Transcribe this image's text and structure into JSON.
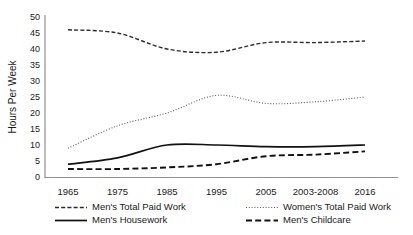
{
  "chart_data": {
    "type": "line",
    "title": "",
    "xlabel": "",
    "ylabel": "Hours Per Week",
    "ylim": [
      0,
      50
    ],
    "ytick_step": 5,
    "grid": false,
    "legend_position": "bottom",
    "axis_color": "#909090",
    "categories": [
      "1965",
      "1975",
      "1985",
      "1995",
      "2005",
      "2003-2008",
      "2016"
    ],
    "series": [
      {
        "name": "Men's Total Paid Work",
        "style": "dashed",
        "color": "#2b2b2b",
        "values": [
          46,
          45,
          40,
          39,
          42,
          42,
          42.5
        ]
      },
      {
        "name": "Women's Total Paid Work",
        "style": "dotted",
        "color": "#5a5a5a",
        "values": [
          9,
          16,
          20,
          25.5,
          23,
          23.5,
          25
        ]
      },
      {
        "name": "Men's Housework",
        "style": "solid",
        "color": "#111111",
        "values": [
          4,
          6,
          10,
          10,
          9.5,
          9.5,
          10
        ]
      },
      {
        "name": "Men's Childcare",
        "style": "bold-dashed",
        "color": "#111111",
        "values": [
          2.5,
          2.5,
          3,
          4,
          6.5,
          7,
          8
        ]
      }
    ]
  }
}
